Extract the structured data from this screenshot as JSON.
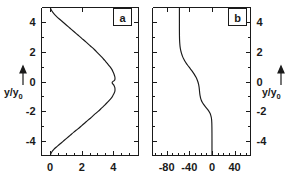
{
  "figure": {
    "background": "#ffffff",
    "foreground": "#1a1a1a",
    "ylabel_main": "y",
    "ylabel_slash": "/",
    "ylabel_den": "y",
    "ylabel_sub": "0",
    "arrow_icon": "up-arrow-icon"
  },
  "chart_data": [
    {
      "type": "line",
      "panel": "a",
      "title": "a",
      "xlabel": "",
      "ylabel": "y/y0",
      "xlim": [
        -0.55,
        5.6
      ],
      "ylim": [
        -5.0,
        5.0
      ],
      "xticks": [
        0,
        2,
        4
      ],
      "xticklabels": [
        "0",
        "2",
        "4"
      ],
      "xminorticks": [
        0.5,
        1,
        1.5,
        2.5,
        3,
        3.5,
        4.5,
        5
      ],
      "yticks": [
        4,
        2,
        0,
        -2,
        -4
      ],
      "yticklabels": [
        "4",
        "2",
        "0",
        "-2",
        "-4"
      ],
      "yminorticks": [
        3,
        1,
        -1,
        -3
      ],
      "grid": false,
      "legend": "none",
      "orientation": "y-vertical-x-horizontal",
      "series": [
        {
          "name": "profile-a",
          "x": [
            0.02,
            0.1,
            0.22,
            0.38,
            0.58,
            0.8,
            1.02,
            1.26,
            1.5,
            1.76,
            2.02,
            2.28,
            2.55,
            2.8,
            3.04,
            3.26,
            3.46,
            3.64,
            3.79,
            3.92,
            4.0,
            4.06,
            4.1,
            4.11,
            4.1,
            4.06,
            4.0,
            3.95,
            3.93,
            3.95,
            4.0,
            4.06,
            4.1,
            4.11,
            4.1,
            4.06,
            4.0,
            3.92,
            3.79,
            3.64,
            3.46,
            3.26,
            3.04,
            2.8,
            2.55,
            2.28,
            2.02,
            1.76,
            1.5,
            1.26,
            1.02,
            0.8,
            0.58,
            0.38,
            0.22,
            0.1,
            0.02
          ],
          "y": [
            4.95,
            4.78,
            4.6,
            4.42,
            4.22,
            4.02,
            3.82,
            3.6,
            3.38,
            3.14,
            2.9,
            2.66,
            2.4,
            2.16,
            1.9,
            1.66,
            1.42,
            1.2,
            1.0,
            0.8,
            0.62,
            0.46,
            0.32,
            0.2,
            0.12,
            0.06,
            0.02,
            -0.02,
            -0.08,
            -0.14,
            -0.2,
            -0.3,
            -0.42,
            -0.55,
            -0.66,
            -0.78,
            -0.9,
            -1.06,
            -1.22,
            -1.4,
            -1.6,
            -1.8,
            -2.02,
            -2.24,
            -2.48,
            -2.72,
            -2.96,
            -3.2,
            -3.42,
            -3.64,
            -3.86,
            -4.06,
            -4.26,
            -4.44,
            -4.6,
            -4.76,
            -4.95
          ]
        }
      ]
    },
    {
      "type": "line",
      "panel": "b",
      "title": "b",
      "xlabel": "",
      "ylabel": "y/y0",
      "xlim": [
        -105,
        68
      ],
      "ylim": [
        -5.0,
        5.0
      ],
      "xticks": [
        -80,
        -40,
        0,
        40
      ],
      "xticklabels": [
        "-80",
        "-40",
        "0",
        "40"
      ],
      "xminorticks": [
        -100,
        -90,
        -70,
        -60,
        -50,
        -30,
        -20,
        -10,
        10,
        20,
        30,
        50,
        60
      ],
      "yticks": [
        4,
        2,
        0,
        -2,
        -4
      ],
      "yticklabels": [
        "4",
        "2",
        "0",
        "-2",
        "-4"
      ],
      "yminorticks": [
        3,
        1,
        -1,
        -3
      ],
      "grid": false,
      "legend": "none",
      "orientation": "y-vertical-x-horizontal",
      "series": [
        {
          "name": "profile-b",
          "x": [
            -57.5,
            -57.5,
            -57.5,
            -57.5,
            -57.4,
            -57.2,
            -56.8,
            -56.2,
            -55.2,
            -53.8,
            -52.0,
            -49.6,
            -46.6,
            -43.0,
            -39.0,
            -35.0,
            -31.4,
            -28.4,
            -26.2,
            -24.6,
            -23.6,
            -22.9,
            -22.4,
            -22.0,
            -21.6,
            -21.0,
            -20.2,
            -19.0,
            -17.2,
            -14.8,
            -11.8,
            -8.6,
            -5.6,
            -3.4,
            -2.0,
            -1.1,
            -0.6,
            -0.3,
            -0.12,
            -0.04,
            0.0,
            0.0,
            0.0
          ],
          "y": [
            4.95,
            4.5,
            4.0,
            3.5,
            3.1,
            2.8,
            2.55,
            2.32,
            2.1,
            1.9,
            1.7,
            1.5,
            1.3,
            1.1,
            0.9,
            0.7,
            0.5,
            0.3,
            0.12,
            -0.05,
            -0.2,
            -0.35,
            -0.5,
            -0.65,
            -0.8,
            -0.95,
            -1.1,
            -1.25,
            -1.4,
            -1.55,
            -1.7,
            -1.85,
            -2.0,
            -2.15,
            -2.3,
            -2.45,
            -2.6,
            -2.8,
            -3.1,
            -3.5,
            -4.0,
            -4.5,
            -4.95
          ]
        }
      ]
    }
  ]
}
